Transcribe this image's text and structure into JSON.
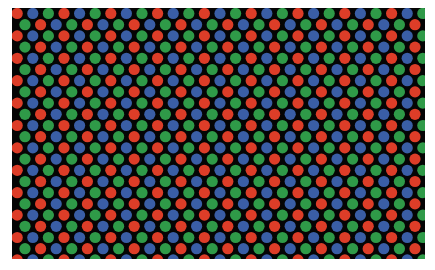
{
  "image": {
    "description": "Macro photo of a display subpixel grid: red, green and blue circular dots on black",
    "background": "#050505",
    "frame": "#ffffff"
  },
  "grid": {
    "dot_radius": 5.6,
    "col_spacing": 15.6,
    "row_spacing": 11.2,
    "even_row_offset_x": 5.2,
    "odd_row_offset_x": 13.0,
    "first_row_y": 5.5,
    "even_row_sequence": [
      "red",
      "blue",
      "green"
    ],
    "odd_row_sequence": [
      "green",
      "red",
      "blue"
    ]
  },
  "colors": {
    "red": "#dd3d28",
    "green": "#2f9a48",
    "blue": "#3a5ea6"
  }
}
